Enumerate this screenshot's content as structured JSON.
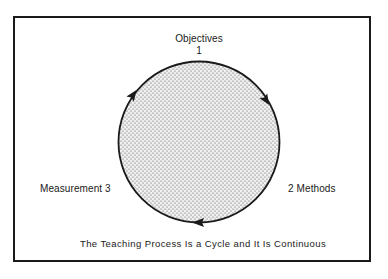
{
  "diagram": {
    "title": "The Teaching Process Is a Cycle and It Is Continuous",
    "nodes": [
      {
        "id": "objectives",
        "label": "Objectives",
        "number": "1",
        "position": "top"
      },
      {
        "id": "methods",
        "label": "2 Methods",
        "number": "2",
        "position": "right"
      },
      {
        "id": "measurement",
        "label": "Measurement 3",
        "number": "3",
        "position": "left"
      }
    ],
    "cycle": {
      "direction": "clockwise",
      "fill": "stippled-gray",
      "arrows": [
        "upper-left",
        "upper-right",
        "bottom"
      ]
    },
    "colors": {
      "stroke": "#1a1a1a",
      "dots": "#555555",
      "background": "#ffffff"
    }
  }
}
